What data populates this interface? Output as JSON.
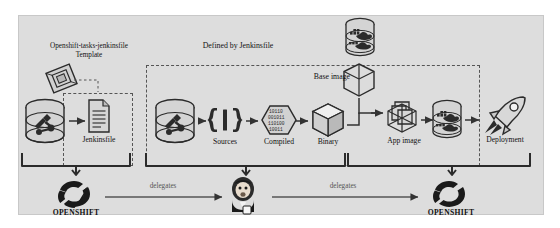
{
  "diagram": {
    "colors": {
      "panel_bg": "#dddddd",
      "page_bg": "#ffffff",
      "stroke": "#333333",
      "dashed": "#555555",
      "icon_fill": "#cfcfcf",
      "icon_dark": "#2b2b2b",
      "text": "#111111"
    },
    "groups": [
      {
        "id": "template-group",
        "label": "Openshift-tasks-jenkinsfile\nTemplate",
        "label_line1": "Openshift-tasks-jenkinsfile",
        "label_line2": "Template"
      },
      {
        "id": "jenkinsfile-group",
        "label": "Defined by Jenkinsfile"
      }
    ],
    "nodes": [
      {
        "id": "git-repo-left",
        "label": "",
        "icon": "git-repository-cylinder-icon"
      },
      {
        "id": "jenkinsfile-doc",
        "label": "Jenkinsfile",
        "icon": "document-icon"
      },
      {
        "id": "template-icon",
        "label": "",
        "icon": "template-blueprint-icon"
      },
      {
        "id": "git-repo-mid",
        "label": "",
        "icon": "git-repository-cylinder-icon"
      },
      {
        "id": "sources",
        "label": "Sources",
        "icon": "code-braces-icon"
      },
      {
        "id": "compiled",
        "label": "Compiled",
        "icon": "binary-hexagon-icon"
      },
      {
        "id": "binary",
        "label": "Binary",
        "icon": "cube-icon"
      },
      {
        "id": "base-image",
        "label": "Base image",
        "icon": "wireframe-cube-icon"
      },
      {
        "id": "app-image",
        "label": "App image",
        "icon": "cube-stack-icon"
      },
      {
        "id": "docker-registry-top",
        "label": "",
        "icon": "docker-registry-cylinder-icon"
      },
      {
        "id": "docker-registry-right",
        "label": "",
        "icon": "docker-registry-cylinder-icon"
      },
      {
        "id": "deployment",
        "label": "Deployment",
        "icon": "rocket-icon"
      }
    ],
    "bottom": {
      "actors": [
        {
          "id": "openshift-left",
          "label": "OPENSHIFT",
          "icon": "openshift-logo-icon"
        },
        {
          "id": "jenkins",
          "label": "",
          "icon": "jenkins-butler-icon"
        },
        {
          "id": "openshift-right",
          "label": "OPENSHIFT",
          "icon": "openshift-logo-icon"
        }
      ],
      "arrows": [
        {
          "id": "delegates-1",
          "label": "delegates"
        },
        {
          "id": "delegates-2",
          "label": "delegates"
        }
      ]
    }
  }
}
